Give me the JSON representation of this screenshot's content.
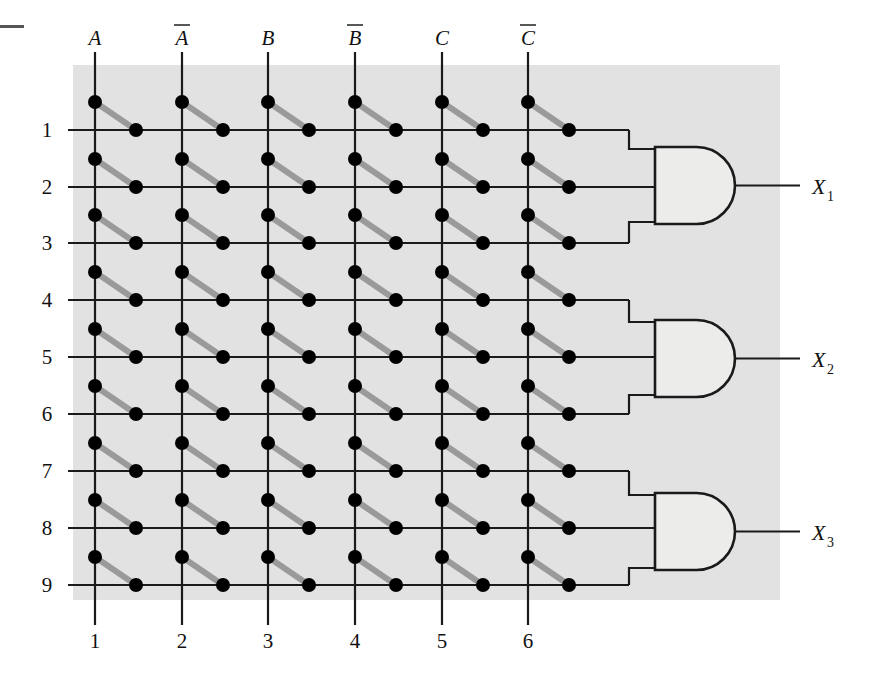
{
  "figure": {
    "name": "pla-fuse-matrix-diagram",
    "panel": {
      "fill": "#e2e2e2",
      "x": 73,
      "y": 65,
      "width": 707,
      "height": 535
    },
    "colors": {
      "panel_gray": "#e2e2e2",
      "line_black": "#1a1a1a",
      "fuse_gray": "#9a9a9a",
      "dot_black": "#000000",
      "gate_fill": "#ececeb",
      "page_white": "#ffffff"
    },
    "corner_mark": {
      "name": "crop-mark-dash",
      "x": 0,
      "y": 25,
      "width": 24,
      "height": 3
    }
  },
  "inputs": {
    "label_y": 45,
    "line_top": 52,
    "items": [
      {
        "label": "A",
        "overbar": false,
        "x": 95,
        "column_index": 1
      },
      {
        "label": "A",
        "overbar": true,
        "x": 182,
        "column_index": 2
      },
      {
        "label": "B",
        "overbar": false,
        "x": 268,
        "column_index": 3
      },
      {
        "label": "B",
        "overbar": true,
        "x": 355,
        "column_index": 4
      },
      {
        "label": "C",
        "overbar": false,
        "x": 442,
        "column_index": 5
      },
      {
        "label": "C",
        "overbar": true,
        "x": 528,
        "column_index": 6
      }
    ]
  },
  "column_numbers": {
    "label_y": 648,
    "tick_bottom": 625,
    "items": [
      {
        "label": "1",
        "x": 95
      },
      {
        "label": "2",
        "x": 182
      },
      {
        "label": "3",
        "x": 268
      },
      {
        "label": "4",
        "x": 355
      },
      {
        "label": "5",
        "x": 442
      },
      {
        "label": "6",
        "x": 528
      }
    ]
  },
  "rows": {
    "label_x": 47,
    "line_start_x": 68,
    "items": [
      {
        "label": "1",
        "y": 130
      },
      {
        "label": "2",
        "y": 187
      },
      {
        "label": "3",
        "y": 243
      },
      {
        "label": "4",
        "y": 300
      },
      {
        "label": "5",
        "y": 357
      },
      {
        "label": "6",
        "y": 414
      },
      {
        "label": "7",
        "y": 471
      },
      {
        "label": "8",
        "y": 528
      },
      {
        "label": "9",
        "y": 585
      }
    ]
  },
  "fuse_links": {
    "description": "Every column/row crossing carries an intact fuse: a dot on the vertical column line above the row, a thick gray diagonal link, and a dot on the horizontal row line offset to the right.",
    "column_dot_dy": -28,
    "row_dot_dx": 41,
    "dot_radius_column": 7,
    "dot_radius_row": 7,
    "link_width": 6
  },
  "gates": [
    {
      "name": "and-gate-1",
      "type": "AND",
      "x": 655,
      "y": 147,
      "width": 80,
      "height": 77,
      "input_rows": [
        1,
        2,
        3
      ],
      "output_label": "X",
      "output_subscript": "1",
      "output_line_end": 800,
      "output_label_x": 812,
      "stub_x": 629
    },
    {
      "name": "and-gate-2",
      "type": "AND",
      "x": 655,
      "y": 320,
      "width": 80,
      "height": 77,
      "input_rows": [
        4,
        5,
        6
      ],
      "output_label": "X",
      "output_subscript": "2",
      "output_line_end": 800,
      "output_label_x": 812,
      "stub_x": 629
    },
    {
      "name": "and-gate-3",
      "type": "AND",
      "x": 655,
      "y": 493,
      "width": 80,
      "height": 77,
      "input_rows": [
        7,
        8,
        9
      ],
      "output_label": "X",
      "output_subscript": "3",
      "output_line_end": 800,
      "output_label_x": 812,
      "stub_x": 629
    }
  ]
}
